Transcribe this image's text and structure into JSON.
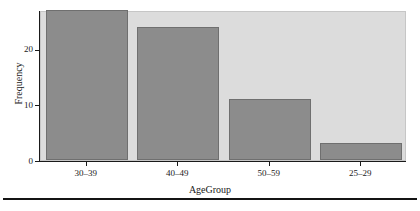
{
  "chart_data": {
    "type": "bar",
    "title": "",
    "subtitle": "",
    "xlabel": "AgeGroup",
    "ylabel": "Frequency",
    "categories": [
      "30–39",
      "40–49",
      "50–59",
      "25–29"
    ],
    "values": [
      27,
      24,
      11,
      3
    ],
    "series": [
      {
        "name": "Frequency",
        "values": [
          27,
          24,
          11,
          3
        ]
      }
    ],
    "ylim": [
      0,
      27
    ],
    "yticks": [
      0,
      10,
      20
    ],
    "ytick_labels": [
      "0",
      "10",
      "20"
    ],
    "xtick_labels": [
      "30–39",
      "40–49",
      "50–59",
      "25–29"
    ],
    "grid": false,
    "legend": "none",
    "annotations": [],
    "colors": {
      "bar_fill": "#8c8c8c",
      "bar_border": "#6f6f6f",
      "panel_background": "#dcdcdc",
      "figure_background": "#ffffff",
      "axis": "#1a1a1a",
      "text": "#1a1a1a",
      "bottom_rule": "#141414"
    }
  }
}
